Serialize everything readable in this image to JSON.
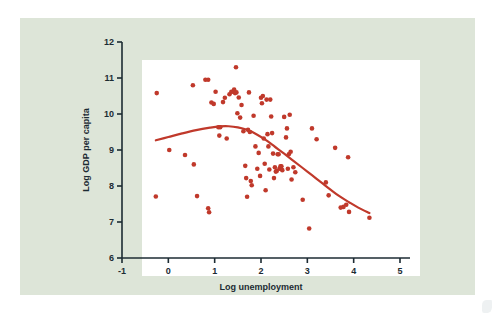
{
  "figure": {
    "panel_background": "#dde5d8",
    "plot_background": "#ffffff",
    "page_background": "#ffffff",
    "axis_color": "#1c2b33",
    "accent_color": "#c0392b"
  },
  "chart_data": {
    "type": "scatter",
    "title": "",
    "xlabel": "Log unemployment",
    "ylabel": "Log GDP per capita",
    "xlim": [
      -1,
      5
    ],
    "ylim": [
      6,
      12
    ],
    "xticks": [
      -1,
      0,
      1,
      2,
      3,
      4,
      5
    ],
    "xtick_labels": [
      "-1",
      "0",
      "1",
      "2",
      "3",
      "4",
      "5"
    ],
    "yticks": [
      6,
      7,
      8,
      9,
      10,
      11,
      12
    ],
    "ytick_labels": [
      "6",
      "7",
      "8",
      "9",
      "10",
      "11",
      "12"
    ],
    "grid": false,
    "legend": null,
    "marker_color": "#c0392b",
    "marker_size": 2.3,
    "points": [
      [
        -0.25,
        10.58
      ],
      [
        -0.27,
        7.71
      ],
      [
        0.02,
        9.0
      ],
      [
        0.36,
        8.86
      ],
      [
        0.53,
        10.8
      ],
      [
        0.55,
        8.6
      ],
      [
        0.62,
        7.72
      ],
      [
        0.8,
        10.95
      ],
      [
        0.86,
        10.95
      ],
      [
        0.86,
        7.38
      ],
      [
        0.88,
        7.27
      ],
      [
        0.93,
        10.32
      ],
      [
        0.98,
        10.28
      ],
      [
        1.02,
        10.62
      ],
      [
        1.08,
        9.63
      ],
      [
        1.1,
        9.4
      ],
      [
        1.12,
        9.63
      ],
      [
        1.18,
        10.33
      ],
      [
        1.22,
        10.45
      ],
      [
        1.26,
        9.32
      ],
      [
        1.32,
        10.55
      ],
      [
        1.36,
        10.62
      ],
      [
        1.4,
        10.62
      ],
      [
        1.42,
        10.68
      ],
      [
        1.44,
        10.58
      ],
      [
        1.46,
        11.3
      ],
      [
        1.47,
        10.6
      ],
      [
        1.49,
        10.02
      ],
      [
        1.52,
        10.46
      ],
      [
        1.55,
        9.9
      ],
      [
        1.58,
        10.25
      ],
      [
        1.62,
        9.52
      ],
      [
        1.66,
        8.56
      ],
      [
        1.68,
        8.22
      ],
      [
        1.7,
        7.7
      ],
      [
        1.72,
        9.56
      ],
      [
        1.74,
        10.6
      ],
      [
        1.76,
        9.5
      ],
      [
        1.78,
        8.14
      ],
      [
        1.8,
        8.02
      ],
      [
        1.84,
        9.95
      ],
      [
        1.88,
        9.1
      ],
      [
        1.92,
        8.48
      ],
      [
        1.95,
        8.92
      ],
      [
        1.98,
        8.28
      ],
      [
        2.0,
        10.45
      ],
      [
        2.02,
        10.3
      ],
      [
        2.04,
        10.5
      ],
      [
        2.06,
        9.32
      ],
      [
        2.08,
        8.62
      ],
      [
        2.1,
        7.88
      ],
      [
        2.12,
        10.4
      ],
      [
        2.14,
        9.44
      ],
      [
        2.16,
        9.1
      ],
      [
        2.18,
        8.46
      ],
      [
        2.2,
        10.4
      ],
      [
        2.22,
        9.93
      ],
      [
        2.24,
        9.47
      ],
      [
        2.26,
        8.9
      ],
      [
        2.28,
        8.22
      ],
      [
        2.3,
        8.52
      ],
      [
        2.32,
        8.4
      ],
      [
        2.34,
        8.42
      ],
      [
        2.36,
        8.88
      ],
      [
        2.38,
        8.88
      ],
      [
        2.4,
        8.48
      ],
      [
        2.42,
        8.55
      ],
      [
        2.44,
        8.55
      ],
      [
        2.46,
        8.44
      ],
      [
        2.5,
        9.92
      ],
      [
        2.54,
        9.35
      ],
      [
        2.56,
        9.6
      ],
      [
        2.58,
        8.48
      ],
      [
        2.6,
        8.88
      ],
      [
        2.62,
        9.98
      ],
      [
        2.64,
        8.95
      ],
      [
        2.66,
        8.18
      ],
      [
        2.7,
        8.52
      ],
      [
        2.74,
        8.38
      ],
      [
        2.9,
        7.62
      ],
      [
        3.04,
        6.82
      ],
      [
        3.1,
        9.6
      ],
      [
        3.2,
        9.3
      ],
      [
        3.4,
        8.1
      ],
      [
        3.46,
        7.74
      ],
      [
        3.6,
        9.06
      ],
      [
        3.72,
        7.4
      ],
      [
        3.78,
        7.42
      ],
      [
        3.84,
        7.48
      ],
      [
        3.88,
        8.8
      ],
      [
        3.9,
        7.28
      ],
      [
        4.34,
        7.12
      ]
    ],
    "fit_curve": {
      "name": "lowess-fit",
      "color": "#c0392b",
      "width": 2.2,
      "points": [
        [
          -0.27,
          9.27
        ],
        [
          0.0,
          9.36
        ],
        [
          0.3,
          9.46
        ],
        [
          0.6,
          9.55
        ],
        [
          0.9,
          9.62
        ],
        [
          1.1,
          9.655
        ],
        [
          1.3,
          9.66
        ],
        [
          1.5,
          9.63
        ],
        [
          1.7,
          9.56
        ],
        [
          1.9,
          9.44
        ],
        [
          2.1,
          9.28
        ],
        [
          2.3,
          9.09
        ],
        [
          2.5,
          8.9
        ],
        [
          2.7,
          8.7
        ],
        [
          2.9,
          8.5
        ],
        [
          3.1,
          8.3
        ],
        [
          3.3,
          8.1
        ],
        [
          3.5,
          7.9
        ],
        [
          3.7,
          7.71
        ],
        [
          3.9,
          7.55
        ],
        [
          4.1,
          7.4
        ],
        [
          4.34,
          7.25
        ]
      ]
    }
  }
}
